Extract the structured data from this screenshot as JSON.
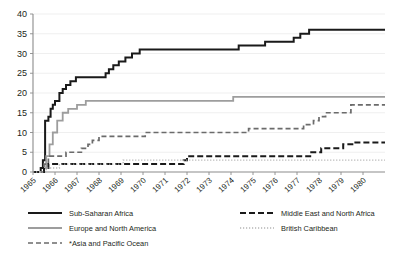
{
  "chart_data": {
    "type": "line",
    "title": "",
    "subtitle": "",
    "xlabel": "",
    "ylabel": "",
    "xlim": [
      1965,
      1981
    ],
    "ylim": [
      0,
      40
    ],
    "yticks": [
      0,
      5,
      10,
      15,
      20,
      25,
      30,
      35,
      40
    ],
    "xticks": [
      "1965",
      "1966",
      "1967",
      "1968",
      "1969",
      "1970",
      "1971",
      "1972",
      "1973",
      "1974",
      "1975",
      "1976",
      "1977",
      "1978",
      "1979",
      "1980"
    ],
    "grid": true,
    "grid_axis": "y",
    "legend_position": "bottom",
    "step_type": "post",
    "series": [
      {
        "name": "Sub-Saharan Africa",
        "color": "#1a1a1a",
        "style": "solid",
        "width": 2.0,
        "points": [
          [
            1965.0,
            0
          ],
          [
            1965.35,
            1
          ],
          [
            1965.45,
            3
          ],
          [
            1965.55,
            13
          ],
          [
            1965.7,
            14
          ],
          [
            1965.8,
            16
          ],
          [
            1965.9,
            17
          ],
          [
            1966.0,
            18
          ],
          [
            1966.2,
            20
          ],
          [
            1966.35,
            21
          ],
          [
            1966.5,
            22
          ],
          [
            1966.7,
            23
          ],
          [
            1966.95,
            24
          ],
          [
            1968.1,
            24
          ],
          [
            1968.3,
            25
          ],
          [
            1968.45,
            26
          ],
          [
            1968.65,
            27
          ],
          [
            1968.9,
            28
          ],
          [
            1969.2,
            29
          ],
          [
            1969.5,
            30
          ],
          [
            1969.85,
            31
          ],
          [
            1974.15,
            31
          ],
          [
            1974.35,
            32
          ],
          [
            1975.2,
            32
          ],
          [
            1975.55,
            33
          ],
          [
            1976.6,
            33
          ],
          [
            1976.85,
            34
          ],
          [
            1977.15,
            35
          ],
          [
            1977.55,
            36
          ],
          [
            1981.0,
            36
          ]
        ]
      },
      {
        "name": "Europe and North America",
        "color": "#9d9d9d",
        "style": "solid",
        "width": 1.8,
        "points": [
          [
            1965.0,
            0
          ],
          [
            1965.5,
            1
          ],
          [
            1965.6,
            4
          ],
          [
            1965.75,
            7
          ],
          [
            1965.9,
            10
          ],
          [
            1966.1,
            13
          ],
          [
            1966.35,
            15
          ],
          [
            1966.6,
            16
          ],
          [
            1967.0,
            17
          ],
          [
            1967.4,
            18
          ],
          [
            1973.9,
            18
          ],
          [
            1974.1,
            19
          ],
          [
            1981.0,
            19
          ]
        ]
      },
      {
        "name": "*Asia and Pacific Ocean",
        "color": "#6b6b6b",
        "style": "dashed",
        "width": 1.7,
        "points": [
          [
            1965.0,
            0
          ],
          [
            1965.5,
            2
          ],
          [
            1965.7,
            4
          ],
          [
            1966.3,
            4
          ],
          [
            1966.5,
            5
          ],
          [
            1967.0,
            5
          ],
          [
            1967.2,
            6
          ],
          [
            1967.5,
            7
          ],
          [
            1967.7,
            8
          ],
          [
            1968.0,
            9
          ],
          [
            1969.8,
            9
          ],
          [
            1970.1,
            10
          ],
          [
            1974.5,
            10
          ],
          [
            1974.8,
            11
          ],
          [
            1977.0,
            11
          ],
          [
            1977.3,
            12
          ],
          [
            1977.75,
            13
          ],
          [
            1978.0,
            14
          ],
          [
            1978.3,
            15
          ],
          [
            1979.2,
            15
          ],
          [
            1979.45,
            17
          ],
          [
            1981.0,
            17
          ]
        ]
      },
      {
        "name": "Middle East and North Africa",
        "color": "#1a1a1a",
        "style": "dashed",
        "width": 2.0,
        "points": [
          [
            1965.0,
            0
          ],
          [
            1965.5,
            1
          ],
          [
            1965.7,
            2
          ],
          [
            1971.6,
            2
          ],
          [
            1971.85,
            3
          ],
          [
            1972.0,
            4
          ],
          [
            1976.9,
            4
          ],
          [
            1977.6,
            5
          ],
          [
            1978.1,
            6
          ],
          [
            1978.7,
            6
          ],
          [
            1979.1,
            7
          ],
          [
            1979.6,
            7.5
          ],
          [
            1981.0,
            7.5
          ]
        ]
      },
      {
        "name": "British Caribbean",
        "color": "#b5b5b5",
        "style": "dotted",
        "width": 1.4,
        "points": [
          [
            1965.0,
            0
          ],
          [
            1965.6,
            1
          ],
          [
            1966.2,
            2
          ],
          [
            1968.9,
            2
          ],
          [
            1969.1,
            3
          ],
          [
            1981.0,
            3
          ]
        ]
      }
    ]
  },
  "legend": {
    "entries": [
      {
        "label": "Sub-Saharan Africa",
        "key": "sub-saharan-africa"
      },
      {
        "label": "Middle East and North Africa",
        "key": "middle-east-north-africa"
      },
      {
        "label": "Europe and North America",
        "key": "europe-north-america"
      },
      {
        "label": "British Caribbean",
        "key": "british-caribbean"
      },
      {
        "label": "*Asia and Pacific Ocean",
        "key": "asia-pacific-ocean"
      }
    ]
  }
}
